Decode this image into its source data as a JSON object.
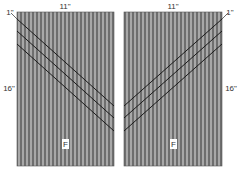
{
  "diagram": {
    "panels": [
      {
        "id": "left",
        "width_label": "11\"",
        "height_label": "16\"",
        "offset_label": "1\"",
        "fabric_label": "F",
        "stripe_direction": "down-right"
      },
      {
        "id": "right",
        "width_label": "11\"",
        "height_label": "16\"",
        "offset_label": "1\"",
        "fabric_label": "F",
        "stripe_direction": "down-left"
      }
    ],
    "colors": {
      "fabric_dark": "#6e6e6e",
      "fabric_light": "#a8a8a8",
      "cut_line": "#1a1a1a",
      "label_bg": "#ffffff"
    }
  }
}
